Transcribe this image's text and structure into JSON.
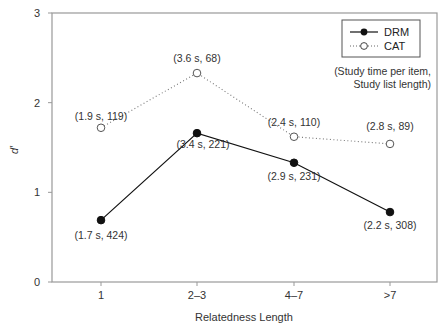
{
  "chart_data": {
    "type": "line",
    "title": "",
    "xlabel": "Relatedness Length",
    "ylabel": "d′",
    "ylim": [
      0,
      3
    ],
    "yticks": [
      "0",
      "1",
      "2",
      "3"
    ],
    "categories": [
      "1",
      "2–3",
      "4–7",
      ">7"
    ],
    "grid": false,
    "legend_position": "upper right",
    "series": [
      {
        "name": "DRM",
        "style": "solid line, filled circle markers",
        "color": "#111111",
        "values": [
          0.69,
          1.66,
          1.33,
          0.78
        ],
        "annotations": [
          "(1.7 s, 424)",
          "(3.4 s, 221)",
          "(2.9 s, 231)",
          "(2.2 s, 308)"
        ]
      },
      {
        "name": "CAT",
        "style": "dotted line, open circle markers",
        "color": "#555555",
        "values": [
          1.72,
          2.33,
          1.62,
          1.54
        ],
        "annotations": [
          "(1.9 s, 119)",
          "(3.6 s, 68)",
          "(2.4 s, 110)",
          "(2.8 s, 89)"
        ]
      }
    ],
    "note_line1": "(Study time per item,",
    "note_line2": "Study list length)"
  }
}
